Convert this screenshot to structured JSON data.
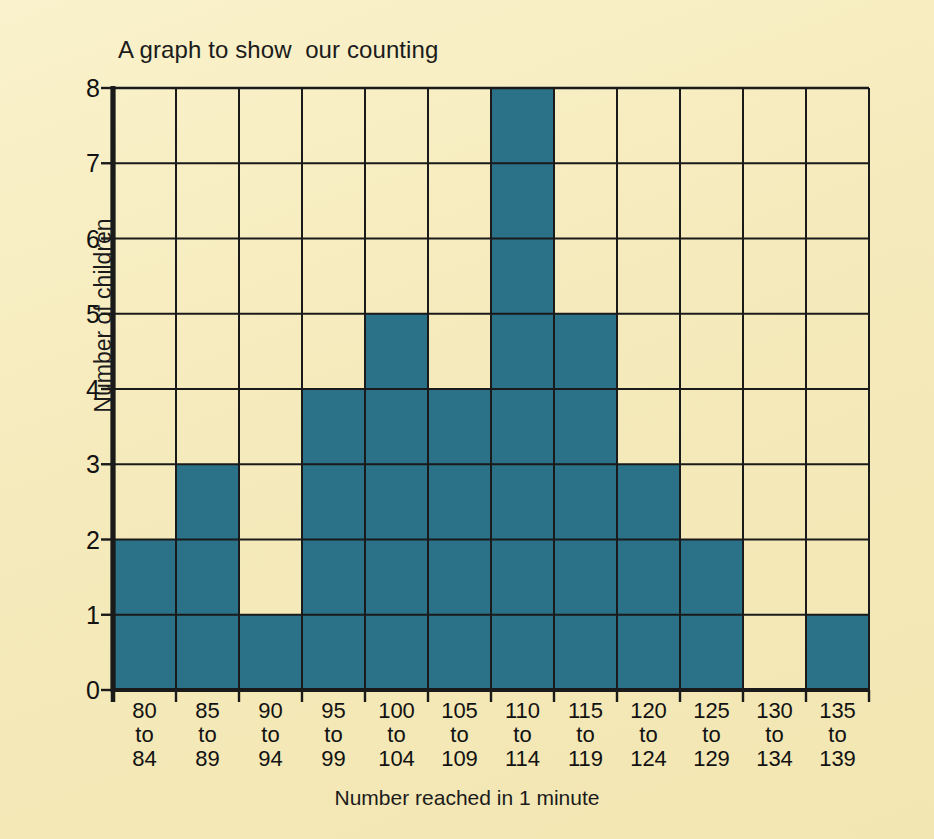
{
  "chart_data": {
    "type": "bar",
    "title": "A graph to show  our counting",
    "xlabel": "Number reached in 1 minute",
    "ylabel": "Number of children",
    "categories": [
      "80 to 84",
      "85 to 89",
      "90 to 94",
      "95 to 99",
      "100 to 104",
      "105 to 109",
      "110 to 114",
      "115 to 119",
      "120 to 124",
      "125 to 129",
      "130 to 134",
      "135 to 139"
    ],
    "category_lines": [
      [
        "80",
        "to",
        "84"
      ],
      [
        "85",
        "to",
        "89"
      ],
      [
        "90",
        "to",
        "94"
      ],
      [
        "95",
        "to",
        "99"
      ],
      [
        "100",
        "to",
        "104"
      ],
      [
        "105",
        "to",
        "109"
      ],
      [
        "110",
        "to",
        "114"
      ],
      [
        "115",
        "to",
        "119"
      ],
      [
        "120",
        "to",
        "124"
      ],
      [
        "125",
        "to",
        "129"
      ],
      [
        "130",
        "to",
        "134"
      ],
      [
        "135",
        "to",
        "139"
      ]
    ],
    "values": [
      2,
      3,
      1,
      4,
      5,
      4,
      8,
      5,
      3,
      2,
      0,
      1
    ],
    "ylim": [
      0,
      8
    ],
    "yticks": [
      0,
      1,
      2,
      3,
      4,
      5,
      6,
      7,
      8
    ],
    "ytick_labels": [
      "0",
      "1",
      "2",
      "3",
      "4",
      "5",
      "6",
      "7",
      "8"
    ],
    "grid": true,
    "legend": false,
    "bar_color": "#2b7289",
    "grid_color": "#1a1a1a",
    "background_color": "#f7eec4",
    "text_color": "#151515"
  }
}
